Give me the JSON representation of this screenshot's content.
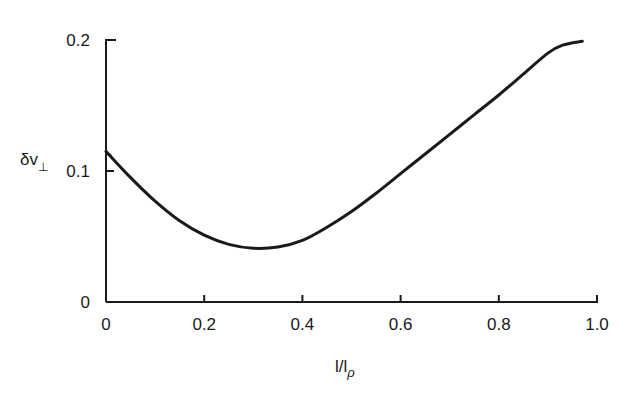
{
  "chart_data": {
    "type": "line",
    "title": "",
    "xlabel": "l/l_ρ",
    "ylabel": "δv_⊥",
    "xlim": [
      0,
      1.0
    ],
    "ylim": [
      0,
      0.2
    ],
    "grid": false,
    "legend": null,
    "x_ticks": [
      "0",
      "0.2",
      "0.4",
      "0.6",
      "0.8",
      "1.0"
    ],
    "y_ticks": [
      "0",
      "0.1",
      "0.2"
    ],
    "series": [
      {
        "name": "δv_⊥",
        "x": [
          0.0,
          0.05,
          0.1,
          0.15,
          0.2,
          0.25,
          0.3,
          0.35,
          0.4,
          0.45,
          0.5,
          0.55,
          0.6,
          0.65,
          0.7,
          0.75,
          0.8,
          0.85,
          0.9,
          0.93,
          0.97
        ],
        "y": [
          0.115,
          0.095,
          0.077,
          0.062,
          0.051,
          0.044,
          0.041,
          0.042,
          0.047,
          0.057,
          0.069,
          0.083,
          0.098,
          0.113,
          0.128,
          0.143,
          0.158,
          0.174,
          0.19,
          0.196,
          0.199
        ]
      }
    ]
  },
  "labels": {
    "ylabel_main": "δv",
    "ylabel_sub": "⊥",
    "xlabel_main": "l/l",
    "xlabel_sub": "ρ"
  }
}
